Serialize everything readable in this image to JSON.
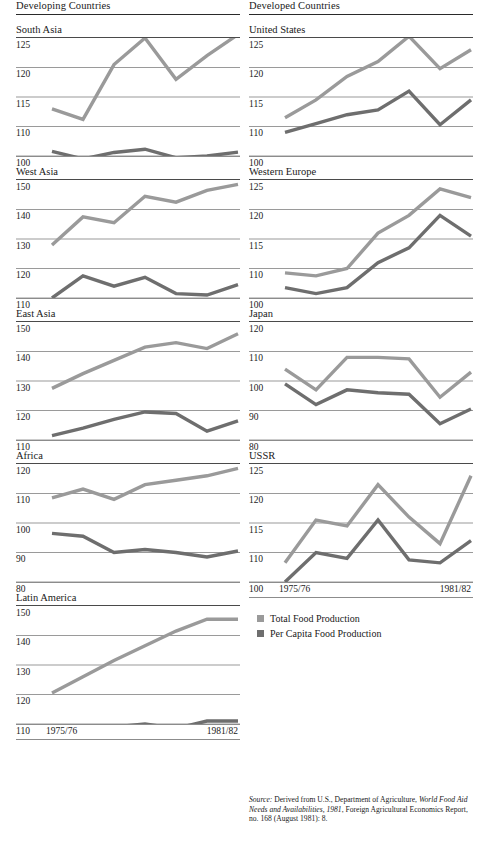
{
  "columns": {
    "left": {
      "heading": "Developing Countries"
    },
    "right": {
      "heading": "Developed Countries"
    }
  },
  "axis": {
    "x_start_label": "1975/76",
    "x_end_label": "1981/82"
  },
  "legend": {
    "items": [
      {
        "label": "Total Food Production",
        "color": "#9a9a9a",
        "key": "total"
      },
      {
        "label": "Per Capita Food Production",
        "color": "#6e6e6e",
        "key": "per_capita"
      }
    ]
  },
  "source": {
    "prefix": "Source:",
    "text_a": " Derived from U.S., Department of Agriculture, ",
    "italic_a": "World Food Aid Needs and Availabilities, 1981",
    "text_b": ", Foreign Agricultural Economics Report, no. 168 (August 1981): 8."
  },
  "chart_data": {
    "type": "line",
    "xlabel": "",
    "ylabel": "Index",
    "grid": true,
    "legend_position": "bottom-right",
    "x": [
      "1975/76",
      "1976/77",
      "1977/78",
      "1978/79",
      "1979/80",
      "1980/81",
      "1981/82"
    ],
    "series_names": [
      "Total Food Production",
      "Per Capita Food Production"
    ],
    "panels": [
      {
        "name": "South Asia",
        "group": "Developing Countries",
        "y_ticks": [
          125,
          120,
          115,
          110,
          100
        ],
        "series": [
          {
            "name": "Total Food Production",
            "key": "total",
            "values": [
              113.0,
              111.2,
              120.5,
              125.0,
              118.0,
              122.0,
              125.6
            ]
          },
          {
            "name": "Per Capita Food Production",
            "key": "per_capita",
            "values": [
              101.6,
              99.0,
              101.2,
              102.3,
              99.4,
              100.0,
              101.3
            ]
          }
        ]
      },
      {
        "name": "West Asia",
        "group": "Developing Countries",
        "y_ticks": [
          150,
          140,
          130,
          120,
          110
        ],
        "series": [
          {
            "name": "Total Food Production",
            "key": "total",
            "values": [
              128.0,
              137.5,
              135.5,
              144.5,
              142.5,
              146.5,
              148.5
            ]
          },
          {
            "name": "Per Capita Food Production",
            "key": "per_capita",
            "values": [
              110.0,
              117.5,
              114.0,
              117.0,
              111.5,
              111.0,
              114.5
            ]
          }
        ]
      },
      {
        "name": "East Asia",
        "group": "Developing Countries",
        "y_ticks": [
          150,
          140,
          130,
          120,
          110
        ],
        "series": [
          {
            "name": "Total Food Production",
            "key": "total",
            "values": [
              127.5,
              132.5,
              137.0,
              141.5,
              143.0,
              141.0,
              146.0
            ]
          },
          {
            "name": "Per Capita Food Production",
            "key": "per_capita",
            "values": [
              111.5,
              114.0,
              117.0,
              119.5,
              119.0,
              113.0,
              116.5
            ]
          }
        ]
      },
      {
        "name": "Africa",
        "group": "Developing Countries",
        "y_ticks": [
          120,
          110,
          100,
          90,
          80
        ],
        "series": [
          {
            "name": "Total Food Production",
            "key": "total",
            "values": [
              108.5,
              111.5,
              108.0,
              113.0,
              114.5,
              116.0,
              118.5
            ]
          },
          {
            "name": "Per Capita Food Production",
            "key": "per_capita",
            "values": [
              96.5,
              95.5,
              90.0,
              91.0,
              90.0,
              88.5,
              90.5
            ]
          }
        ]
      },
      {
        "name": "Latin America",
        "group": "Developing Countries",
        "y_ticks": [
          150,
          140,
          130,
          120,
          110
        ],
        "series": [
          {
            "name": "Total Food Production",
            "key": "total",
            "values": [
              120.5,
              126.0,
              131.5,
              136.5,
              141.5,
              145.5,
              145.5
            ]
          },
          {
            "name": "Per Capita Food Production",
            "key": "per_capita",
            "values": [
              107.5,
              108.5,
              109.0,
              110.0,
              108.5,
              111.0,
              111.0
            ]
          }
        ]
      },
      {
        "name": "United States",
        "group": "Developed Countries",
        "y_ticks": [
          125,
          120,
          115,
          110,
          100
        ],
        "series": [
          {
            "name": "Total Food Production",
            "key": "total",
            "values": [
              111.5,
              114.5,
              118.5,
              121.0,
              125.3,
              119.8,
              123.0
            ]
          },
          {
            "name": "Per Capita Food Production",
            "key": "per_capita",
            "values": [
              108.0,
              110.5,
              112.0,
              112.8,
              116.0,
              110.3,
              114.5
            ]
          }
        ]
      },
      {
        "name": "Western Europe",
        "group": "Developed Countries",
        "y_ticks": [
          125,
          120,
          115,
          110,
          100
        ],
        "series": [
          {
            "name": "Total Food Production",
            "key": "total",
            "values": [
              108.5,
              107.5,
              110.0,
              116.0,
              119.0,
              123.5,
              122.0
            ]
          },
          {
            "name": "Per Capita Food Production",
            "key": "per_capita",
            "values": [
              103.5,
              101.5,
              103.5,
              111.0,
              113.5,
              119.0,
              115.5
            ]
          }
        ]
      },
      {
        "name": "Japan",
        "group": "Developed Countries",
        "y_ticks": [
          120,
          110,
          100,
          90,
          80
        ],
        "series": [
          {
            "name": "Total Food Production",
            "key": "total",
            "values": [
              104.0,
              97.0,
              108.0,
              108.0,
              107.5,
              94.5,
              103.0
            ]
          },
          {
            "name": "Per Capita Food Production",
            "key": "per_capita",
            "values": [
              99.0,
              92.0,
              97.0,
              96.0,
              95.5,
              85.5,
              90.5
            ]
          }
        ]
      },
      {
        "name": "USSR",
        "group": "Developed Countries",
        "y_ticks": [
          125,
          120,
          115,
          110,
          100
        ],
        "series": [
          {
            "name": "Total Food Production",
            "key": "total",
            "values": [
              106.5,
              115.5,
              114.5,
              121.5,
              116.0,
              111.5,
              123.0
            ]
          },
          {
            "name": "Per Capita Food Production",
            "key": "per_capita",
            "values": [
              100.0,
              110.0,
              108.0,
              115.5,
              107.5,
              106.5,
              112.0
            ]
          }
        ]
      }
    ]
  }
}
